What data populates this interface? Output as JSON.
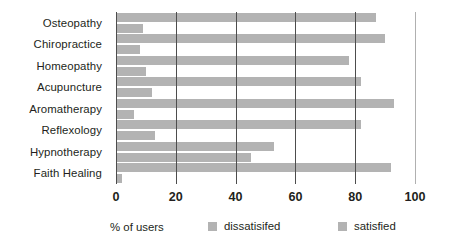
{
  "chart_data": {
    "type": "bar",
    "orientation": "horizontal",
    "title": "",
    "xlabel": "% of users",
    "ylabel": "",
    "xlim": [
      0,
      100
    ],
    "xticks": [
      0,
      20,
      40,
      60,
      80,
      100
    ],
    "grid": true,
    "legend_position": "bottom",
    "categories": [
      "Osteopathy",
      "Chiropractice",
      "Homeopathy",
      "Acupuncture",
      "Aromatherapy",
      "Reflexology",
      "Hypnotherapy",
      "Faith Healing"
    ],
    "series": [
      {
        "name": "satisfied",
        "color": "#b3b3b3",
        "values": [
          87,
          90,
          78,
          82,
          93,
          82,
          53,
          92
        ]
      },
      {
        "name": "dissatisifed",
        "color": "#b3b3b3",
        "values": [
          9,
          8,
          10,
          12,
          6,
          13,
          45,
          2
        ]
      }
    ]
  },
  "axis": {
    "caption": "% of users",
    "tick_labels": [
      "0",
      "20",
      "40",
      "60",
      "80",
      "100"
    ]
  },
  "legend": {
    "items": [
      {
        "label": "dissatisifed",
        "swatch_color": "#b3b3b3"
      },
      {
        "label": "satisfied",
        "swatch_color": "#b3b3b3"
      }
    ]
  }
}
